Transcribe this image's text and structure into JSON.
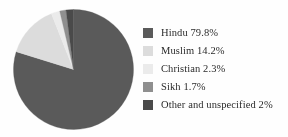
{
  "chart_data": {
    "type": "pie",
    "title": "",
    "subtitle": "",
    "xlabel": "",
    "ylabel": "",
    "grid": false,
    "legend_position": "right",
    "start_angle_deg": 0,
    "direction": "clockwise",
    "categories": [
      "Hindu",
      "Muslim",
      "Christian",
      "Sikh",
      "Other and unspecified"
    ],
    "values": [
      79.8,
      14.2,
      2.3,
      1.7,
      2.0
    ],
    "value_unit": "%",
    "colors": [
      "#5a5a5a",
      "#dcdcdc",
      "#ebebeb",
      "#8f8f8f",
      "#4a4a4a"
    ],
    "slices": [
      {
        "label": "Hindu",
        "value": 79.8,
        "display": "79.8%",
        "color": "#5a5a5a"
      },
      {
        "label": "Muslim",
        "value": 14.2,
        "display": "14.2%",
        "color": "#dcdcdc"
      },
      {
        "label": "Christian",
        "value": 2.3,
        "display": "2.3%",
        "color": "#ebebeb"
      },
      {
        "label": "Sikh",
        "value": 1.7,
        "display": "1.7%",
        "color": "#8f8f8f"
      },
      {
        "label": "Other and unspecified",
        "value": 2.0,
        "display": "2%",
        "color": "#4a4a4a"
      }
    ]
  },
  "legend": {
    "items": [
      {
        "swatch_name": "legend-swatch-hindu",
        "label": "Hindu 79.8%",
        "color": "#5a5a5a"
      },
      {
        "swatch_name": "legend-swatch-muslim",
        "label": "Muslim 14.2%",
        "color": "#dcdcdc"
      },
      {
        "swatch_name": "legend-swatch-christian",
        "label": "Christian 2.3%",
        "color": "#ebebeb"
      },
      {
        "swatch_name": "legend-swatch-sikh",
        "label": "Sikh 1.7%",
        "color": "#8f8f8f"
      },
      {
        "swatch_name": "legend-swatch-other",
        "label": "Other and unspecified  2%",
        "color": "#4a4a4a"
      }
    ]
  },
  "figure": {
    "background": "#fefefe",
    "text_color": "#2b2b2b",
    "pie_center_x": 60.5,
    "pie_center_y": 60.5,
    "pie_radius": 60
  }
}
